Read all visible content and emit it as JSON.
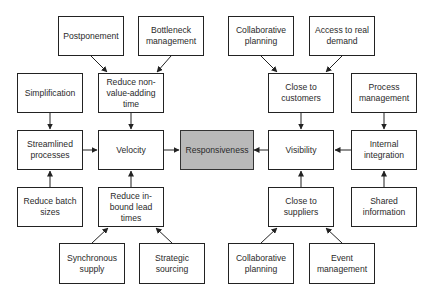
{
  "diagram": {
    "type": "cause-effect flow diagram",
    "center": {
      "id": "responsiveness",
      "label": "Responsiveness",
      "fill": "#b9b9b9"
    },
    "nodes": {
      "postponement": {
        "label": "Postponement"
      },
      "bottleneck": {
        "label": "Bottleneck management"
      },
      "collab_top": {
        "label": "Collaborative planning"
      },
      "access_demand": {
        "label": "Access to real demand"
      },
      "simplification": {
        "label": "Simplification"
      },
      "reduce_nva": {
        "label": "Reduce non-value-adding time"
      },
      "close_customers": {
        "label": "Close to customers"
      },
      "process_mgmt": {
        "label": "Process management"
      },
      "streamlined": {
        "label": "Streamlined processes"
      },
      "velocity": {
        "label": "Velocity"
      },
      "responsiveness": {
        "label": "Responsiveness"
      },
      "visibility": {
        "label": "Visibility"
      },
      "internal_integration": {
        "label": "Internal integration"
      },
      "reduce_batch": {
        "label": "Reduce batch sizes"
      },
      "reduce_inbound": {
        "label": "Reduce in-bound lead times"
      },
      "close_suppliers": {
        "label": "Close to suppliers"
      },
      "shared_info": {
        "label": "Shared information"
      },
      "synchronous": {
        "label": "Synchronous supply"
      },
      "strategic": {
        "label": "Strategic sourcing"
      },
      "collab_bottom": {
        "label": "Collaborative planning"
      },
      "event_mgmt": {
        "label": "Event management"
      }
    },
    "edges": [
      {
        "from": "postponement",
        "to": "reduce_nva"
      },
      {
        "from": "bottleneck",
        "to": "reduce_nva"
      },
      {
        "from": "simplification",
        "to": "streamlined"
      },
      {
        "from": "reduce_nva",
        "to": "velocity"
      },
      {
        "from": "streamlined",
        "to": "velocity"
      },
      {
        "from": "reduce_batch",
        "to": "streamlined"
      },
      {
        "from": "reduce_inbound",
        "to": "velocity"
      },
      {
        "from": "synchronous",
        "to": "reduce_inbound"
      },
      {
        "from": "strategic",
        "to": "reduce_inbound"
      },
      {
        "from": "velocity",
        "to": "responsiveness"
      },
      {
        "from": "visibility",
        "to": "responsiveness"
      },
      {
        "from": "collab_top",
        "to": "close_customers"
      },
      {
        "from": "access_demand",
        "to": "close_customers"
      },
      {
        "from": "close_customers",
        "to": "visibility"
      },
      {
        "from": "process_mgmt",
        "to": "internal_integration"
      },
      {
        "from": "internal_integration",
        "to": "visibility"
      },
      {
        "from": "shared_info",
        "to": "internal_integration"
      },
      {
        "from": "close_suppliers",
        "to": "visibility"
      },
      {
        "from": "collab_bottom",
        "to": "close_suppliers"
      },
      {
        "from": "event_mgmt",
        "to": "close_suppliers"
      }
    ]
  }
}
